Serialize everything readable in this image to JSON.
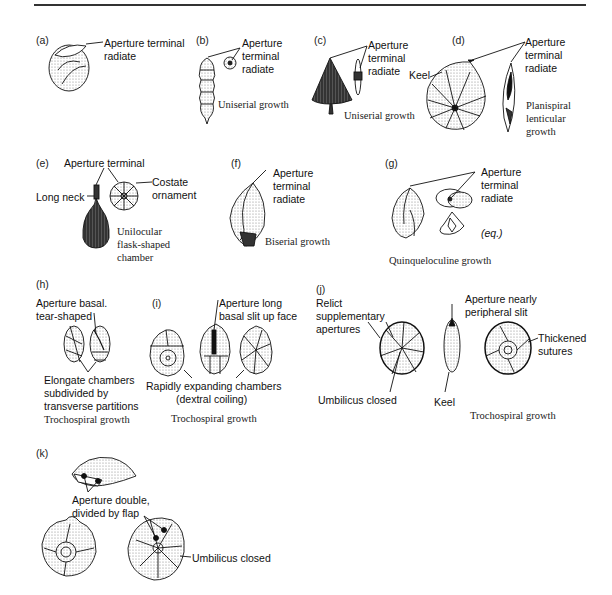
{
  "figure": {
    "panels": [
      {
        "id": "(a)",
        "labels": [
          "Aperture terminal",
          "radiate"
        ],
        "growth": ""
      },
      {
        "id": "(b)",
        "labels": [
          "Aperture",
          "terminal",
          "radiate"
        ],
        "growth": "Uniserial growth"
      },
      {
        "id": "(c)",
        "labels": [
          "Aperture",
          "terminal",
          "radiate"
        ],
        "growth": "Uniserial growth"
      },
      {
        "id": "(d)",
        "labels": [
          "Aperture",
          "terminal",
          "radiate",
          "Keel"
        ],
        "growth": [
          "Planispiral",
          "lenticular",
          "growth"
        ]
      },
      {
        "id": "(e)",
        "labels": [
          "Aperture terminal",
          "Long neck",
          "Costate",
          "ornament"
        ],
        "growth": [
          "Unilocular",
          "flask-shaped",
          "chamber"
        ]
      },
      {
        "id": "(f)",
        "labels": [
          "Aperture",
          "terminal",
          "radiate"
        ],
        "growth": "Biserial growth"
      },
      {
        "id": "(g)",
        "labels": [
          "Aperture",
          "terminal",
          "radiate",
          "(eq.)"
        ],
        "growth": "Quinqueloculine growth"
      },
      {
        "id": "(h)",
        "labels": [
          "Aperture basal.",
          "tear-shaped",
          "Elongate chambers",
          "subdivided by",
          "transverse partitions"
        ],
        "growth": "Trochospiral growth"
      },
      {
        "id": "(i)",
        "labels": [
          "Aperture long",
          "basal slit up face",
          "Rapidly expanding chambers",
          "(dextral coiling)"
        ],
        "growth": "Trochospiral growth"
      },
      {
        "id": "(j)",
        "labels": [
          "Relict",
          "supplementary",
          "apertures",
          "Aperture nearly",
          "peripheral slit",
          "Thickened",
          "sutures",
          "Umbilicus closed",
          "Keel"
        ],
        "growth": "Trochospiral growth"
      },
      {
        "id": "(k)",
        "labels": [
          "Aperture double,",
          "divided by flap",
          "Umbilicus closed"
        ],
        "growth": ""
      }
    ]
  }
}
